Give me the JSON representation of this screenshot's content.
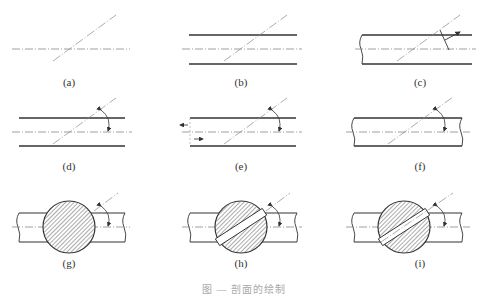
{
  "figure": {
    "caption": "图 — 剖面的绘制",
    "panels": [
      {
        "id": "a",
        "label": "(a)",
        "description": "center line crossed by inclined cutting line"
      },
      {
        "id": "b",
        "label": "(b)",
        "description": "two parallel outlines with center line and inclined cutting line"
      },
      {
        "id": "c",
        "label": "(c)",
        "description": "broken shaft with cutting line and perpendicular view arrow"
      },
      {
        "id": "d",
        "label": "(d)",
        "description": "parallel outlines with cutting line and rotation arc arrow"
      },
      {
        "id": "e",
        "label": "(e)",
        "description": "open shaft with direction arrows and rotation arc arrow"
      },
      {
        "id": "f",
        "label": "(f)",
        "description": "broken shaft with cutting line and rotation arc arrow"
      },
      {
        "id": "g",
        "label": "(g)",
        "description": "shaft with fully hatched circular section and rotation arrow"
      },
      {
        "id": "h",
        "label": "(h)",
        "description": "shaft with hatched circular section and inclined slot"
      },
      {
        "id": "i",
        "label": "(i)",
        "description": "shaft with hatched circular section, slot and center line"
      }
    ]
  },
  "colors": {
    "line": "#333333",
    "thin": "#777777",
    "hatch": "#555555"
  }
}
